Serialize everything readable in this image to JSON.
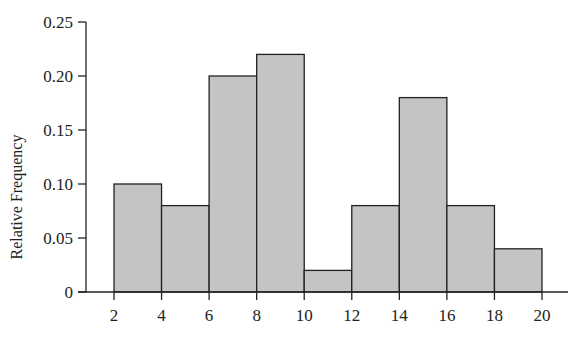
{
  "chart_data": {
    "type": "bar",
    "subtype": "histogram",
    "title": "",
    "xlabel": "",
    "ylabel": "Relative Frequency",
    "bins": [
      {
        "start": 2,
        "end": 4,
        "value": 0.1
      },
      {
        "start": 4,
        "end": 6,
        "value": 0.08
      },
      {
        "start": 6,
        "end": 8,
        "value": 0.2
      },
      {
        "start": 8,
        "end": 10,
        "value": 0.22
      },
      {
        "start": 10,
        "end": 12,
        "value": 0.02
      },
      {
        "start": 12,
        "end": 14,
        "value": 0.08
      },
      {
        "start": 14,
        "end": 16,
        "value": 0.18
      },
      {
        "start": 16,
        "end": 18,
        "value": 0.08
      },
      {
        "start": 18,
        "end": 20,
        "value": 0.04
      }
    ],
    "categories": [
      "2-4",
      "4-6",
      "6-8",
      "8-10",
      "10-12",
      "12-14",
      "14-16",
      "16-18",
      "18-20"
    ],
    "values": [
      0.1,
      0.08,
      0.2,
      0.22,
      0.02,
      0.08,
      0.18,
      0.08,
      0.04
    ],
    "xticks": [
      "2",
      "4",
      "6",
      "8",
      "10",
      "12",
      "14",
      "16",
      "18",
      "20"
    ],
    "xtick_values": [
      2,
      4,
      6,
      8,
      10,
      12,
      14,
      16,
      18,
      20
    ],
    "yticks": [
      "0",
      "0.05",
      "0.10",
      "0.15",
      "0.20",
      "0.25"
    ],
    "ytick_values": [
      0,
      0.05,
      0.1,
      0.15,
      0.2,
      0.25
    ],
    "xlim": [
      0.8,
      21.1
    ],
    "ylim": [
      0,
      0.25
    ],
    "grid": false,
    "legend": "none",
    "bar_color": "#c4c4c4",
    "edge_color": "#222222"
  }
}
